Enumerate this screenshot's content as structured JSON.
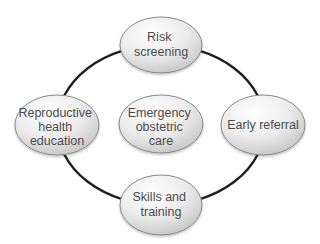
{
  "diagram": {
    "type": "cycle",
    "ring_color": "#1f1f1f",
    "node_fill_light": "#ffffff",
    "node_fill_dark": "#c9c9c9",
    "node_stroke": "#8a8a8a",
    "nodes": [
      {
        "id": "top",
        "lines": [
          "Risk",
          "screening"
        ]
      },
      {
        "id": "left",
        "lines": [
          "Reproductive",
          "health",
          "education"
        ]
      },
      {
        "id": "center",
        "lines": [
          "Emergency",
          "obstetric",
          "care"
        ]
      },
      {
        "id": "right",
        "lines": [
          "Early referral"
        ]
      },
      {
        "id": "bottom",
        "lines": [
          "Skills and",
          "training"
        ]
      }
    ]
  }
}
